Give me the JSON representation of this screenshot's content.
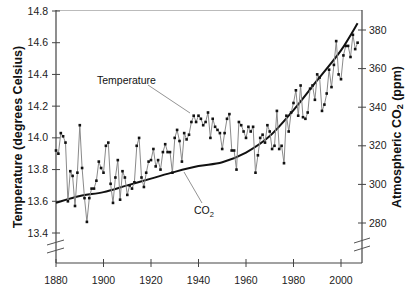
{
  "chart_data": {
    "type": "line",
    "title": "",
    "xlabel": "",
    "ylabel_left": "Temperature (degrees Celsius)",
    "ylabel_right": "Atmospheric CO2 (ppm)",
    "ylabel_right_parts": {
      "prefix": "Atmospheric CO",
      "sub": "2",
      "suffix": " (ppm)"
    },
    "xlim": [
      1880,
      2008
    ],
    "ylim_left": [
      13.3,
      14.8
    ],
    "ylim_right": [
      270,
      390
    ],
    "x_ticks": [
      1880,
      1900,
      1920,
      1940,
      1960,
      1980,
      2000
    ],
    "x_tick_labels": [
      "1880",
      "1900",
      "1920",
      "1940",
      "1960",
      "1980",
      "2000"
    ],
    "y_left_ticks": [
      13.4,
      13.6,
      13.8,
      14.0,
      14.2,
      14.4,
      14.6,
      14.8
    ],
    "y_left_tick_labels": [
      "13.4",
      "13.6",
      "13.8",
      "14.0",
      "14.2",
      "14.4",
      "14.6",
      "14.8"
    ],
    "y_right_ticks": [
      280,
      300,
      320,
      340,
      360,
      380
    ],
    "y_right_tick_labels": [
      "280",
      "300",
      "320",
      "340",
      "360",
      "380"
    ],
    "grid": false,
    "legend": null,
    "annotations": [
      {
        "text": "Temperature",
        "target_series": "Temperature",
        "x": 1903,
        "y_left": 14.3
      },
      {
        "text": "CO2",
        "text_parts": {
          "main": "CO",
          "sub": "2"
        },
        "target_series": "CO2",
        "x": 1929,
        "y_left": 13.6
      }
    ],
    "axis_breaks": [
      "left-y-below-13.4",
      "right-y-below-280"
    ],
    "series": [
      {
        "name": "Temperature",
        "axis": "left",
        "unit": "degrees Celsius",
        "style": "gray line with black square markers",
        "x": [
          1880,
          1881,
          1882,
          1883,
          1884,
          1885,
          1886,
          1887,
          1888,
          1889,
          1890,
          1891,
          1892,
          1893,
          1894,
          1895,
          1896,
          1897,
          1898,
          1899,
          1900,
          1901,
          1902,
          1903,
          1904,
          1905,
          1906,
          1907,
          1908,
          1909,
          1910,
          1911,
          1912,
          1913,
          1914,
          1915,
          1916,
          1917,
          1918,
          1919,
          1920,
          1921,
          1922,
          1923,
          1924,
          1925,
          1926,
          1927,
          1928,
          1929,
          1930,
          1931,
          1932,
          1933,
          1934,
          1935,
          1936,
          1937,
          1938,
          1939,
          1940,
          1941,
          1942,
          1943,
          1944,
          1945,
          1946,
          1947,
          1948,
          1949,
          1950,
          1951,
          1952,
          1953,
          1954,
          1955,
          1956,
          1957,
          1958,
          1959,
          1960,
          1961,
          1962,
          1963,
          1964,
          1965,
          1966,
          1967,
          1968,
          1969,
          1970,
          1971,
          1972,
          1973,
          1974,
          1975,
          1976,
          1977,
          1978,
          1979,
          1980,
          1981,
          1982,
          1983,
          1984,
          1985,
          1986,
          1987,
          1988,
          1989,
          1990,
          1991,
          1992,
          1993,
          1994,
          1995,
          1996,
          1997,
          1998,
          1999,
          2000,
          2001,
          2002,
          2003,
          2004,
          2005,
          2006,
          2007
        ],
        "values": [
          13.92,
          13.9,
          14.03,
          14.01,
          13.97,
          13.6,
          13.79,
          13.76,
          13.57,
          13.78,
          14.08,
          13.81,
          13.62,
          13.47,
          13.62,
          13.68,
          13.68,
          13.73,
          13.85,
          13.81,
          13.78,
          13.95,
          13.97,
          13.71,
          13.59,
          13.75,
          13.86,
          13.61,
          13.79,
          13.75,
          13.64,
          13.7,
          13.68,
          13.72,
          13.95,
          14.0,
          13.75,
          13.69,
          13.78,
          13.85,
          13.86,
          13.93,
          13.82,
          13.86,
          13.8,
          13.91,
          13.96,
          13.91,
          13.91,
          13.78,
          14.0,
          14.05,
          13.98,
          13.85,
          14.03,
          13.99,
          14.02,
          14.1,
          14.14,
          14.1,
          14.14,
          14.12,
          14.08,
          14.1,
          14.16,
          14.0,
          14.12,
          14.07,
          14.05,
          14.03,
          13.93,
          14.03,
          14.12,
          14.15,
          13.92,
          13.92,
          13.8,
          14.1,
          14.08,
          14.04,
          14.0,
          14.07,
          14.04,
          14.07,
          13.78,
          13.89,
          14.0,
          14.02,
          13.97,
          14.08,
          14.04,
          13.93,
          13.95,
          14.17,
          13.93,
          13.95,
          13.84,
          14.14,
          14.04,
          14.16,
          14.22,
          14.3,
          14.14,
          14.33,
          14.13,
          14.12,
          14.16,
          14.31,
          14.33,
          14.24,
          14.4,
          14.38,
          14.17,
          14.21,
          14.28,
          14.43,
          14.32,
          14.46,
          14.61,
          14.4,
          14.37,
          14.52,
          14.58,
          14.58,
          14.51,
          14.65,
          14.56,
          14.6
        ]
      },
      {
        "name": "CO2",
        "axis": "right",
        "unit": "ppm",
        "style": "black smooth line",
        "x": [
          1880,
          1890,
          1900,
          1910,
          1920,
          1930,
          1940,
          1950,
          1960,
          1970,
          1980,
          1990,
          2000,
          2007
        ],
        "values": [
          290.5,
          294,
          296,
          299.5,
          303,
          306.5,
          309.5,
          311.5,
          316.5,
          325,
          338.5,
          354,
          369.5,
          383.5
        ]
      }
    ]
  }
}
